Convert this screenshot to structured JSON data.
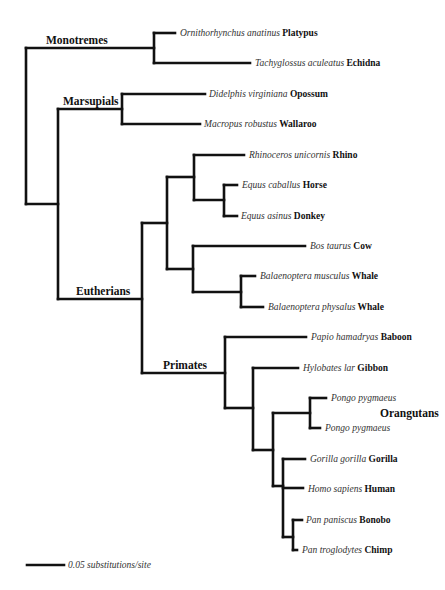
{
  "figure": {
    "type": "phylogenetic-tree",
    "scale_bar": {
      "label": "0.05 substitutions/site",
      "x1": 27,
      "x2": 64,
      "y": 565
    },
    "clades": [
      {
        "id": "monotremes",
        "label": "Monotremes",
        "x": 46,
        "y": 44
      },
      {
        "id": "marsupials",
        "label": "Marsupials",
        "x": 63,
        "y": 105
      },
      {
        "id": "eutherians",
        "label": "Eutherians",
        "x": 76,
        "y": 295
      },
      {
        "id": "primates",
        "label": "Primates",
        "x": 163,
        "y": 369
      },
      {
        "id": "orangutans",
        "label": "Orangutans",
        "x": 380,
        "y": 417
      }
    ],
    "taxa": [
      {
        "id": "platypus",
        "species": "Ornithorhynchus anatinus",
        "common": "Platypus",
        "x": 180,
        "y": 36
      },
      {
        "id": "echidna",
        "species": "Tachyglossus aculeatus",
        "common": "Echidna",
        "x": 255,
        "y": 66
      },
      {
        "id": "opossum",
        "species": "Didelphis virginiana",
        "common": "Opossum",
        "x": 209,
        "y": 97
      },
      {
        "id": "wallaroo",
        "species": "Macropus robustus",
        "common": "Wallaroo",
        "x": 204,
        "y": 127
      },
      {
        "id": "rhino",
        "species": "Rhinoceros unicornis",
        "common": "Rhino",
        "x": 249,
        "y": 158
      },
      {
        "id": "horse",
        "species": "Equus caballus",
        "common": "Horse",
        "x": 242,
        "y": 188
      },
      {
        "id": "donkey",
        "species": "Equus asinus",
        "common": "Donkey",
        "x": 241,
        "y": 219
      },
      {
        "id": "cow",
        "species": "Bos taurus",
        "common": "Cow",
        "x": 310,
        "y": 249
      },
      {
        "id": "blue-whale",
        "species": "Balaenoptera musculus",
        "common": "Whale",
        "x": 260,
        "y": 279
      },
      {
        "id": "fin-whale",
        "species": "Balaenoptera physalus",
        "common": "Whale",
        "x": 268,
        "y": 310
      },
      {
        "id": "baboon",
        "species": "Papio hamadryas",
        "common": "Baboon",
        "x": 311,
        "y": 340
      },
      {
        "id": "gibbon",
        "species": "Hylobates lar",
        "common": "Gibbon",
        "x": 303,
        "y": 371
      },
      {
        "id": "orangutan-1",
        "species": "Pongo pygmaeus",
        "common": "",
        "x": 331,
        "y": 401
      },
      {
        "id": "orangutan-2",
        "species": "Pongo pygmaeus",
        "common": "",
        "x": 325,
        "y": 431
      },
      {
        "id": "gorilla",
        "species": "Gorilla gorilla",
        "common": "Gorilla",
        "x": 310,
        "y": 462
      },
      {
        "id": "human",
        "species": "Homo sapiens",
        "common": "Human",
        "x": 308,
        "y": 492
      },
      {
        "id": "bonobo",
        "species": "Pan paniscus",
        "common": "Bonobo",
        "x": 306,
        "y": 523
      },
      {
        "id": "chimp",
        "species": "Pan troglodytes",
        "common": "Chimp",
        "x": 302,
        "y": 553
      }
    ],
    "branches": [
      "M26,48 L26,204",
      "M26,48 L154,48",
      "M154,33 L154,63",
      "M154,33 L175,33",
      "M154,63 L250,63",
      "M26,204 L58,204",
      "M58,109 L58,299",
      "M58,109 L122,109",
      "M122,94 L122,124",
      "M122,94 L205,94",
      "M122,124 L200,124",
      "M58,299 L142,299",
      "M142,223 L142,373",
      "M142,223 L167,223",
      "M167,177 L167,269",
      "M167,177 L194,177",
      "M194,155 L194,200",
      "M194,155 L244,155",
      "M194,200 L224,200",
      "M224,185 L224,216",
      "M224,185 L237,185",
      "M224,216 L237,216",
      "M167,269 L193,269",
      "M193,246 L193,292",
      "M193,246 L305,246",
      "M193,292 L241,292",
      "M241,276 L241,307",
      "M241,276 L255,276",
      "M241,307 L263,307",
      "M142,373 L225,373",
      "M225,337 L225,408",
      "M225,337 L306,337",
      "M225,408 L253,408",
      "M253,368 L253,450",
      "M253,368 L298,368",
      "M253,450 L273,450",
      "M273,413 L273,486",
      "M273,413 L310,413",
      "M310,398 L310,428",
      "M310,398 L326,398",
      "M310,428 L320,428",
      "M273,486 L283,486",
      "M283,459 L283,537",
      "M283,459 L305,459",
      "M283,488 L303,488",
      "M283,537 L293,537",
      "M293,520 L293,550",
      "M293,520 L302,520",
      "M293,550 L297,550"
    ]
  }
}
